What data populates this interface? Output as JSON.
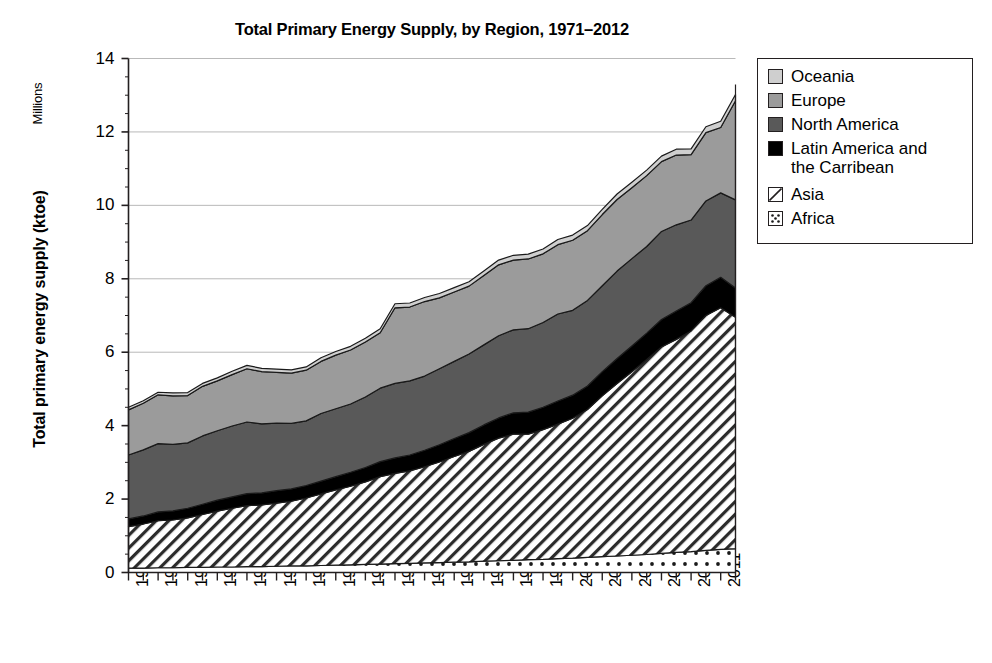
{
  "chart_data": {
    "type": "area",
    "stacked": true,
    "title": "Total Primary Energy Supply, by Region, 1971–2012",
    "xlabel": "",
    "ylabel": "Total primary energy supply (ktoe)",
    "y_unit_label": "Millions",
    "ylim": [
      0,
      14
    ],
    "yticks": [
      0,
      2,
      4,
      6,
      8,
      10,
      12,
      14
    ],
    "ytick_labels": [
      "0",
      "2",
      "4",
      "6",
      "8",
      "10",
      "12",
      "14"
    ],
    "grid": true,
    "grid_axis": "y",
    "legend_position": "right",
    "x": [
      1971,
      1972,
      1973,
      1974,
      1975,
      1976,
      1977,
      1978,
      1979,
      1980,
      1981,
      1982,
      1983,
      1984,
      1985,
      1986,
      1987,
      1988,
      1989,
      1990,
      1991,
      1992,
      1993,
      1994,
      1995,
      1996,
      1997,
      1998,
      1999,
      2000,
      2001,
      2002,
      2003,
      2004,
      2005,
      2006,
      2007,
      2008,
      2009,
      2010,
      2011,
      2012
    ],
    "xtick_labels": [
      "1971",
      "1973",
      "1975",
      "1977",
      "1979",
      "1981",
      "1983",
      "1985",
      "1987",
      "1989",
      "1991",
      "1993",
      "1995",
      "1997",
      "1999",
      "2001",
      "2003",
      "2005",
      "2007",
      "2009",
      "2011"
    ],
    "stack_order_bottom_to_top": [
      "Africa",
      "Asia",
      "Latin America and the Carribean",
      "North America",
      "Europe",
      "Oceania"
    ],
    "series": [
      {
        "name": "Africa",
        "fill": "dotted",
        "color": "#ffffff",
        "values": [
          0.12,
          0.12,
          0.13,
          0.13,
          0.14,
          0.14,
          0.15,
          0.15,
          0.16,
          0.16,
          0.17,
          0.18,
          0.18,
          0.19,
          0.2,
          0.21,
          0.22,
          0.23,
          0.24,
          0.25,
          0.26,
          0.27,
          0.28,
          0.29,
          0.31,
          0.32,
          0.33,
          0.35,
          0.36,
          0.38,
          0.39,
          0.41,
          0.43,
          0.45,
          0.47,
          0.49,
          0.52,
          0.55,
          0.57,
          0.6,
          0.63,
          0.65
        ]
      },
      {
        "name": "Asia",
        "fill": "diagonal-hatch",
        "color": "#ffffff",
        "values": [
          1.13,
          1.2,
          1.28,
          1.3,
          1.35,
          1.44,
          1.52,
          1.6,
          1.66,
          1.68,
          1.72,
          1.76,
          1.85,
          1.95,
          2.05,
          2.14,
          2.25,
          2.38,
          2.46,
          2.52,
          2.62,
          2.74,
          2.88,
          3.01,
          3.18,
          3.34,
          3.44,
          3.42,
          3.53,
          3.66,
          3.81,
          4.03,
          4.38,
          4.7,
          5.0,
          5.31,
          5.62,
          5.8,
          6.01,
          6.4,
          6.58,
          6.3
        ]
      },
      {
        "name": "Latin America and the Carribean",
        "fill": "solid",
        "color": "#000000",
        "values": [
          0.21,
          0.22,
          0.24,
          0.25,
          0.26,
          0.28,
          0.3,
          0.31,
          0.33,
          0.33,
          0.34,
          0.34,
          0.34,
          0.35,
          0.36,
          0.38,
          0.39,
          0.41,
          0.42,
          0.43,
          0.45,
          0.47,
          0.49,
          0.51,
          0.53,
          0.55,
          0.58,
          0.6,
          0.61,
          0.63,
          0.63,
          0.64,
          0.66,
          0.68,
          0.7,
          0.72,
          0.75,
          0.77,
          0.77,
          0.81,
          0.83,
          0.8
        ]
      },
      {
        "name": "North America",
        "fill": "solid",
        "color": "#595959",
        "values": [
          1.74,
          1.8,
          1.86,
          1.81,
          1.78,
          1.86,
          1.89,
          1.93,
          1.95,
          1.88,
          1.84,
          1.78,
          1.76,
          1.84,
          1.85,
          1.86,
          1.92,
          2.0,
          2.03,
          2.02,
          2.02,
          2.07,
          2.1,
          2.14,
          2.18,
          2.24,
          2.26,
          2.27,
          2.31,
          2.37,
          2.31,
          2.33,
          2.34,
          2.38,
          2.38,
          2.36,
          2.4,
          2.35,
          2.25,
          2.31,
          2.3,
          2.4
        ]
      },
      {
        "name": "Europe",
        "fill": "solid",
        "color": "#9b9b9b",
        "values": [
          1.23,
          1.27,
          1.33,
          1.32,
          1.29,
          1.35,
          1.36,
          1.4,
          1.45,
          1.42,
          1.38,
          1.37,
          1.38,
          1.42,
          1.46,
          1.47,
          1.5,
          1.51,
          2.06,
          2.01,
          2.03,
          1.93,
          1.89,
          1.85,
          1.89,
          1.93,
          1.9,
          1.9,
          1.87,
          1.89,
          1.91,
          1.9,
          1.94,
          1.95,
          1.93,
          1.93,
          1.9,
          1.9,
          1.78,
          1.86,
          1.78,
          2.7
        ]
      },
      {
        "name": "Oceania",
        "fill": "solid",
        "color": "#cfcfcf",
        "values": [
          0.07,
          0.07,
          0.07,
          0.08,
          0.08,
          0.08,
          0.08,
          0.09,
          0.09,
          0.09,
          0.09,
          0.09,
          0.09,
          0.1,
          0.1,
          0.1,
          0.1,
          0.11,
          0.11,
          0.11,
          0.11,
          0.12,
          0.12,
          0.12,
          0.12,
          0.13,
          0.13,
          0.13,
          0.13,
          0.14,
          0.14,
          0.14,
          0.14,
          0.15,
          0.15,
          0.15,
          0.15,
          0.16,
          0.16,
          0.16,
          0.17,
          0.17
        ]
      }
    ],
    "totals": [
      4.5,
      4.68,
      4.91,
      4.89,
      4.9,
      5.15,
      5.3,
      5.48,
      5.64,
      5.56,
      5.54,
      5.52,
      5.6,
      5.85,
      6.02,
      6.16,
      6.38,
      6.64,
      7.32,
      7.34,
      7.49,
      7.6,
      7.76,
      7.92,
      8.21,
      8.51,
      8.64,
      8.67,
      8.81,
      9.07,
      9.19,
      9.45,
      9.89,
      10.31,
      10.63,
      10.96,
      11.34,
      11.53,
      11.54,
      12.14,
      12.29,
      12.02
    ]
  },
  "legend": {
    "items": [
      {
        "label": "Oceania",
        "fill": "solid",
        "color": "#cfcfcf"
      },
      {
        "label": "Europe",
        "fill": "solid",
        "color": "#9b9b9b"
      },
      {
        "label": "North America",
        "fill": "solid",
        "color": "#595959"
      },
      {
        "label": "Latin America and\nthe Carribean",
        "fill": "solid",
        "color": "#000000"
      },
      {
        "label": "Asia",
        "fill": "diagonal-hatch",
        "color": "#ffffff"
      },
      {
        "label": "Africa",
        "fill": "dotted",
        "color": "#ffffff"
      }
    ]
  }
}
